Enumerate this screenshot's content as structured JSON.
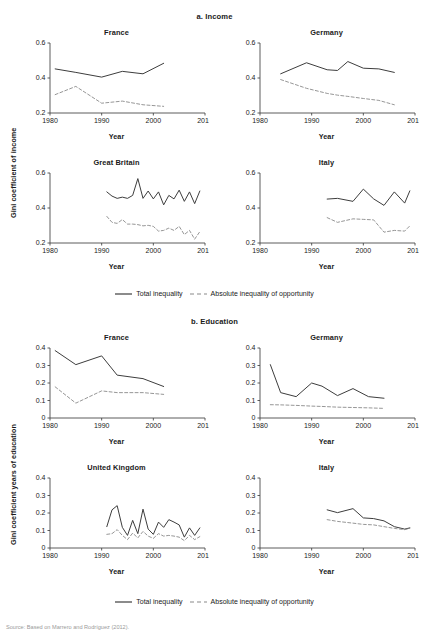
{
  "figure": {
    "sections": [
      {
        "id": "income",
        "title": "a. Income"
      },
      {
        "id": "education",
        "title": "b. Education"
      }
    ],
    "axis_titles": {
      "income_y": "Gini coefficient of income",
      "education_y": "Gini coefficient years of education",
      "x": "Year"
    },
    "legend": {
      "total_label": "Total inequality",
      "opportunity_label": "Absolute inequality of opportunity",
      "total_style": "solid",
      "opportunity_style": "dashed"
    },
    "source_note": "Source: Based on Marrero and Rodríguez (2012)."
  },
  "chart_data": [
    {
      "type": "line",
      "title": "France",
      "section": "a. Income",
      "xlabel": "Year",
      "ylabel": "Gini coefficient of income",
      "xlim": [
        1980,
        2010
      ],
      "ylim": [
        0.2,
        0.6
      ],
      "xticks": [
        1980,
        1990,
        2000,
        2010
      ],
      "yticks": [
        0.2,
        0.4,
        0.6
      ],
      "grid": false,
      "legend_position": "below-figure",
      "series": [
        {
          "name": "Total inequality",
          "style": "solid",
          "x": [
            1981,
            1985,
            1990,
            1994,
            1998,
            2002
          ],
          "values": [
            0.452,
            0.432,
            0.405,
            0.438,
            0.424,
            0.484
          ]
        },
        {
          "name": "Absolute inequality of opportunity",
          "style": "dashed",
          "x": [
            1981,
            1985,
            1990,
            1994,
            1998,
            2002
          ],
          "values": [
            0.305,
            0.352,
            0.256,
            0.268,
            0.247,
            0.238
          ]
        }
      ]
    },
    {
      "type": "line",
      "title": "Germany",
      "section": "a. Income",
      "xlabel": "Year",
      "ylabel": "Gini coefficient of income",
      "xlim": [
        1980,
        2010
      ],
      "ylim": [
        0.2,
        0.6
      ],
      "xticks": [
        1980,
        1990,
        2000,
        2010
      ],
      "yticks": [
        0.2,
        0.4,
        0.6
      ],
      "grid": false,
      "legend_position": "below-figure",
      "series": [
        {
          "name": "Total inequality",
          "style": "solid",
          "x": [
            1984,
            1989,
            1993,
            1995,
            1997,
            2000,
            2003,
            2006
          ],
          "values": [
            0.424,
            0.487,
            0.447,
            0.443,
            0.494,
            0.456,
            0.452,
            0.432
          ]
        },
        {
          "name": "Absolute inequality of opportunity",
          "style": "dashed",
          "x": [
            1984,
            1989,
            1993,
            1995,
            1997,
            2000,
            2003,
            2006
          ],
          "values": [
            0.391,
            0.341,
            0.312,
            0.302,
            0.295,
            0.283,
            0.272,
            0.247
          ]
        }
      ]
    },
    {
      "type": "line",
      "title": "Great Britain",
      "section": "a. Income",
      "xlabel": "Year",
      "ylabel": "Gini coefficient of income",
      "xlim": [
        1980,
        2010
      ],
      "ylim": [
        0.2,
        0.6
      ],
      "xticks": [
        1980,
        1990,
        2000,
        2010
      ],
      "yticks": [
        0.2,
        0.4,
        0.6
      ],
      "grid": false,
      "legend_position": "below-figure",
      "series": [
        {
          "name": "Total inequality",
          "style": "solid",
          "x": [
            1991,
            1992,
            1993,
            1994,
            1995,
            1996,
            1997,
            1998,
            1999,
            2000,
            2001,
            2002,
            2003,
            2004,
            2005,
            2006,
            2007,
            2008,
            2009
          ],
          "values": [
            0.492,
            0.468,
            0.455,
            0.462,
            0.455,
            0.472,
            0.568,
            0.455,
            0.497,
            0.452,
            0.492,
            0.418,
            0.472,
            0.452,
            0.502,
            0.438,
            0.492,
            0.425,
            0.497
          ]
        },
        {
          "name": "Absolute inequality of opportunity",
          "style": "dashed",
          "x": [
            1991,
            1992,
            1993,
            1994,
            1995,
            1996,
            1997,
            1998,
            1999,
            2000,
            2001,
            2002,
            2003,
            2004,
            2005,
            2006,
            2007,
            2008,
            2009
          ],
          "values": [
            0.352,
            0.318,
            0.312,
            0.334,
            0.308,
            0.308,
            0.305,
            0.298,
            0.301,
            0.295,
            0.268,
            0.272,
            0.285,
            0.272,
            0.295,
            0.248,
            0.272,
            0.222,
            0.265
          ]
        }
      ]
    },
    {
      "type": "line",
      "title": "Italy",
      "section": "a. Income",
      "xlabel": "Year",
      "ylabel": "Gini coefficient of income",
      "xlim": [
        1980,
        2010
      ],
      "ylim": [
        0.2,
        0.6
      ],
      "xticks": [
        1980,
        1990,
        2000,
        2010
      ],
      "yticks": [
        0.2,
        0.4,
        0.6
      ],
      "grid": false,
      "legend_position": "below-figure",
      "series": [
        {
          "name": "Total inequality",
          "style": "solid",
          "x": [
            1993,
            1995,
            1998,
            2000,
            2002,
            2004,
            2006,
            2008,
            2009
          ],
          "values": [
            0.451,
            0.455,
            0.438,
            0.508,
            0.452,
            0.415,
            0.492,
            0.428,
            0.498
          ]
        },
        {
          "name": "Absolute inequality of opportunity",
          "style": "dashed",
          "x": [
            1993,
            1995,
            1998,
            2000,
            2002,
            2004,
            2006,
            2008,
            2009
          ],
          "values": [
            0.345,
            0.318,
            0.338,
            0.335,
            0.332,
            0.262,
            0.272,
            0.268,
            0.298
          ]
        }
      ]
    },
    {
      "type": "line",
      "title": "France",
      "section": "b. Education",
      "xlabel": "Year",
      "ylabel": "Gini coefficient years of education",
      "xlim": [
        1980,
        2010
      ],
      "ylim": [
        0,
        0.4
      ],
      "xticks": [
        1980,
        1990,
        2000,
        2010
      ],
      "yticks": [
        0,
        0.1,
        0.2,
        0.3,
        0.4
      ],
      "grid": false,
      "legend_position": "below-figure",
      "series": [
        {
          "name": "Total inequality",
          "style": "solid",
          "x": [
            1981,
            1985,
            1990,
            1993,
            1998,
            2002
          ],
          "values": [
            0.385,
            0.305,
            0.355,
            0.245,
            0.225,
            0.18
          ]
        },
        {
          "name": "Absolute inequality of opportunity",
          "style": "dashed",
          "x": [
            1981,
            1985,
            1990,
            1993,
            1998,
            2002
          ],
          "values": [
            0.178,
            0.085,
            0.155,
            0.145,
            0.145,
            0.135
          ]
        }
      ]
    },
    {
      "type": "line",
      "title": "Germany",
      "section": "b. Education",
      "xlabel": "Year",
      "ylabel": "Gini coefficient years of education",
      "xlim": [
        1980,
        2010
      ],
      "ylim": [
        0,
        0.4
      ],
      "xticks": [
        1980,
        1990,
        2000,
        2010
      ],
      "yticks": [
        0,
        0.1,
        0.2,
        0.3,
        0.4
      ],
      "grid": false,
      "legend_position": "below-figure",
      "series": [
        {
          "name": "Total inequality",
          "style": "solid",
          "x": [
            1982,
            1984,
            1987,
            1990,
            1992,
            1995,
            1998,
            2001,
            2004
          ],
          "values": [
            0.305,
            0.145,
            0.122,
            0.2,
            0.182,
            0.128,
            0.168,
            0.122,
            0.113
          ]
        },
        {
          "name": "Absolute inequality of opportunity",
          "style": "dashed",
          "x": [
            1982,
            1984,
            1987,
            1990,
            1992,
            1995,
            1998,
            2001,
            2004
          ],
          "values": [
            0.076,
            0.075,
            0.072,
            0.068,
            0.066,
            0.062,
            0.06,
            0.058,
            0.055
          ]
        }
      ]
    },
    {
      "type": "line",
      "title": "United Kingdom",
      "section": "b. Education",
      "xlabel": "Year",
      "ylabel": "Gini coefficient years of education",
      "xlim": [
        1980,
        2010
      ],
      "ylim": [
        0,
        0.4
      ],
      "xticks": [
        1980,
        1990,
        2000,
        2010
      ],
      "yticks": [
        0,
        0.1,
        0.2,
        0.3,
        0.4
      ],
      "grid": false,
      "legend_position": "below-figure",
      "series": [
        {
          "name": "Total inequality",
          "style": "solid",
          "x": [
            1991,
            1992,
            1993,
            1994,
            1995,
            1996,
            1997,
            1998,
            1999,
            2000,
            2001,
            2002,
            2003,
            2004,
            2005,
            2006,
            2007,
            2008,
            2009
          ],
          "values": [
            0.122,
            0.218,
            0.242,
            0.118,
            0.072,
            0.158,
            0.082,
            0.222,
            0.108,
            0.078,
            0.148,
            0.118,
            0.162,
            0.148,
            0.132,
            0.062,
            0.115,
            0.072,
            0.115
          ]
        },
        {
          "name": "Absolute inequality of opportunity",
          "style": "dashed",
          "x": [
            1991,
            1992,
            1993,
            1994,
            1995,
            1996,
            1997,
            1998,
            1999,
            2000,
            2001,
            2002,
            2003,
            2004,
            2005,
            2006,
            2007,
            2008,
            2009
          ],
          "values": [
            0.078,
            0.082,
            0.105,
            0.072,
            0.048,
            0.085,
            0.058,
            0.095,
            0.068,
            0.055,
            0.082,
            0.068,
            0.072,
            0.068,
            0.062,
            0.042,
            0.072,
            0.048,
            0.065
          ]
        }
      ]
    },
    {
      "type": "line",
      "title": "Italy",
      "section": "b. Education",
      "xlabel": "Year",
      "ylabel": "Gini coefficient years of education",
      "xlim": [
        1980,
        2010
      ],
      "ylim": [
        0,
        0.4
      ],
      "xticks": [
        1980,
        1990,
        2000,
        2010
      ],
      "yticks": [
        0,
        0.1,
        0.2,
        0.3,
        0.4
      ],
      "grid": false,
      "legend_position": "below-figure",
      "series": [
        {
          "name": "Total inequality",
          "style": "solid",
          "x": [
            1993,
            1995,
            1998,
            2000,
            2002,
            2004,
            2006,
            2008,
            2009
          ],
          "values": [
            0.218,
            0.202,
            0.225,
            0.172,
            0.168,
            0.155,
            0.122,
            0.108,
            0.115
          ]
        },
        {
          "name": "Absolute inequality of opportunity",
          "style": "dashed",
          "x": [
            1993,
            1995,
            1998,
            2000,
            2002,
            2004,
            2006,
            2008,
            2009
          ],
          "values": [
            0.162,
            0.152,
            0.142,
            0.135,
            0.132,
            0.122,
            0.112,
            0.105,
            0.112
          ]
        }
      ]
    }
  ]
}
